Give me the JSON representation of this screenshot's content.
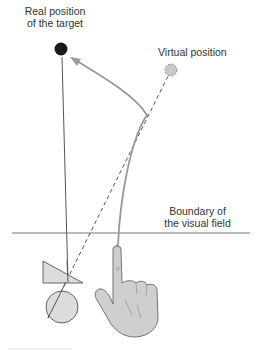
{
  "diagram": {
    "labels": {
      "real_position": [
        "Real position",
        "of the target"
      ],
      "virtual_position": "Virtual position",
      "boundary": [
        "Boundary of",
        "the visual field"
      ]
    },
    "colors": {
      "real_target": "#1a1a1a",
      "virtual_target": "#c8c8c8",
      "line": "#555555",
      "arrow_path": "#999999",
      "prism_fill": "#dcdcdc",
      "hand_fill": "#cfcfcf",
      "hand_stroke": "#666666"
    },
    "elements": [
      "real-target-dot",
      "virtual-target-dot",
      "line-of-sight-to-real-target",
      "dashed-line-of-sight-to-virtual-target",
      "pointing-trajectory-arrow",
      "visual-field-boundary-line",
      "prism-triangle",
      "eye-circle",
      "pointing-hand"
    ]
  }
}
